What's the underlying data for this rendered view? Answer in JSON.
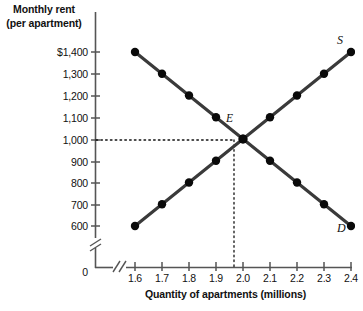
{
  "chart_data": {
    "type": "line",
    "title": "",
    "ylabel": "Monthly rent\n(per apartment)",
    "ylabel_line1": "Monthly rent",
    "ylabel_line2": "(per apartment)",
    "xlabel": "Quantity of apartments (millions)",
    "x": [
      1.6,
      1.7,
      1.8,
      1.9,
      2.0,
      2.1,
      2.2,
      2.3,
      2.4
    ],
    "xtick_labels": [
      "1.6",
      "1.7",
      "1.8",
      "1.9",
      "2.0",
      "2.1",
      "2.2",
      "2.3",
      "2.4"
    ],
    "ytick_labels": [
      "$1,400",
      "1,300",
      "1,200",
      "1,100",
      "1,000",
      "900",
      "800",
      "700",
      "600"
    ],
    "ytick_values": [
      1400,
      1300,
      1200,
      1100,
      1000,
      900,
      800,
      700,
      600
    ],
    "origin_label": "0",
    "xlim": [
      1.6,
      2.4
    ],
    "ylim": [
      600,
      1400
    ],
    "grid": false,
    "axis_break_x": true,
    "axis_break_y": true,
    "legend": "none",
    "series": [
      {
        "name": "Demand",
        "label": "D",
        "values": [
          1400,
          1300,
          1200,
          1100,
          1000,
          900,
          800,
          700,
          600
        ],
        "color": "#3a3a3a"
      },
      {
        "name": "Supply",
        "label": "S",
        "values": [
          600,
          700,
          800,
          900,
          1000,
          1100,
          1200,
          1300,
          1400
        ],
        "color": "#3a3a3a"
      }
    ],
    "annotations": [
      {
        "name": "equilibrium",
        "label": "E",
        "x": 2.0,
        "y": 1000,
        "guide_lines": "dotted"
      }
    ]
  },
  "colors": {
    "curve": "#3a3a3a",
    "marker": "#0a0a0a",
    "axis": "#555555",
    "text": "#111111",
    "background": "#ffffff"
  }
}
